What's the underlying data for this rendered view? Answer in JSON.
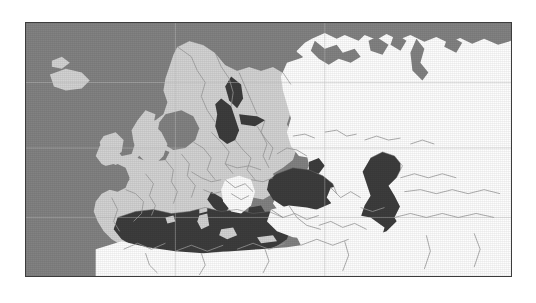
{
  "page": {
    "background_color": "#ffffff",
    "width": 536,
    "height": 303
  },
  "figure": {
    "name": "europe-choropleth-map",
    "title": "",
    "caption": "",
    "frame": {
      "x": 25,
      "y": 22,
      "width": 487,
      "height": 255,
      "border_color": "#3c3c3c",
      "border_width": 1
    }
  },
  "legend": {
    "visible": false,
    "entries": [
      {
        "label": "Highlighted countries",
        "color": "#d2d2d2"
      },
      {
        "label": "Other countries",
        "color": "#fdfdfd"
      },
      {
        "label": "Ocean",
        "color": "#828282"
      },
      {
        "label": "Inland seas",
        "color": "#3d3d3d"
      }
    ]
  },
  "colors": {
    "ocean": "#828282",
    "inland_sea": "#3d3d3d",
    "highlight_land": "#d2d2d2",
    "other_land": "#fdfdfd",
    "border_line": "#9a9a9a",
    "coast_line": "#6e6e6e",
    "graticule": "#bdbdbd",
    "frame": "#3c3c3c"
  },
  "graticule": {
    "visible": true,
    "horizontal_lines": [
      60,
      126,
      196
    ],
    "vertical_lines": [
      150,
      300
    ]
  },
  "regions": {
    "highlighted": [
      "Iceland",
      "Ireland",
      "United Kingdom",
      "Norway",
      "Sweden",
      "Finland",
      "Denmark",
      "Estonia",
      "Latvia",
      "Lithuania",
      "Poland",
      "Germany",
      "Netherlands",
      "Belgium",
      "France",
      "Spain",
      "Portugal",
      "Italy",
      "Switzerland",
      "Austria",
      "Czechia",
      "Slovakia",
      "Hungary",
      "Slovenia",
      "Croatia",
      "Romania",
      "Bulgaria",
      "Greece",
      "Belarus",
      "Ukraine",
      "Moldova"
    ],
    "not_highlighted": [
      "Russia",
      "Turkey",
      "Serbia",
      "Bosnia and Herzegovina",
      "Albania",
      "North Macedonia",
      "Morocco",
      "Algeria",
      "Tunisia",
      "Libya",
      "Egypt",
      "Syria",
      "Iraq",
      "Iran",
      "Georgia",
      "Armenia",
      "Azerbaijan",
      "Kazakhstan",
      "Uzbekistan",
      "Turkmenistan"
    ]
  },
  "water_bodies": [
    "Atlantic Ocean",
    "North Sea",
    "Norwegian Sea",
    "Barents Sea",
    "Baltic Sea",
    "Mediterranean Sea",
    "Black Sea",
    "Caspian Sea",
    "Aral Sea"
  ]
}
